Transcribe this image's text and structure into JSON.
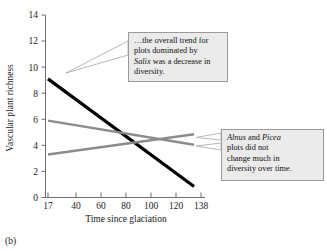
{
  "panel": {
    "label": "(b)"
  },
  "chart_data": {
    "type": "line",
    "title": "",
    "xlabel": "Time since glaciation",
    "ylabel": "Vascular plant richness",
    "xlim": [
      17,
      138
    ],
    "ylim": [
      0,
      14
    ],
    "xticks": [
      "17",
      "40",
      "60",
      "80",
      "100",
      "120",
      "138"
    ],
    "xtick_values": [
      17,
      40,
      60,
      80,
      100,
      120,
      138
    ],
    "yticks": [
      "0",
      "2",
      "4",
      "6",
      "8",
      "10",
      "12",
      "14"
    ],
    "ytick_values": [
      0,
      2,
      4,
      6,
      8,
      10,
      12,
      14
    ],
    "grid": false,
    "legend": "none",
    "series": [
      {
        "name": "Salix",
        "color": "#000000",
        "width": 3.2,
        "x": [
          17,
          133
        ],
        "values": [
          9.1,
          0.85
        ]
      },
      {
        "name": "Alnus",
        "color": "#8c8c8c",
        "width": 2.4,
        "x": [
          17,
          133
        ],
        "values": [
          5.9,
          4.05
        ]
      },
      {
        "name": "Picea",
        "color": "#8c8c8c",
        "width": 2.4,
        "x": [
          17,
          133
        ],
        "values": [
          3.3,
          4.85
        ]
      }
    ]
  },
  "callouts": {
    "salix": {
      "lines": [
        "…the overall trend for",
        "plots dominated by",
        "was a decrease in",
        "diversity."
      ],
      "italic_term": "Salix",
      "line3_prefix": "",
      "line3_suffix": " was a decrease in"
    },
    "alnus": {
      "italic_term_1": "Alnus",
      "mid": " and ",
      "italic_term_2": "Picea",
      "lines": [
        "plots did not",
        "change much in",
        "diversity over time."
      ]
    }
  },
  "colors": {
    "line_dark": "#000000",
    "line_gray": "#8c8c8c",
    "axis": "#6e6e6e",
    "callout_fill": "#ebebeb",
    "callout_border": "#9a9a9a",
    "leader": "#b0b0b0"
  }
}
